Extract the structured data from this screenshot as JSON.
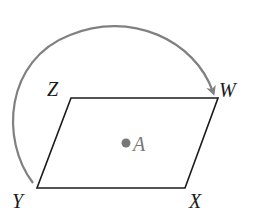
{
  "diagram": {
    "type": "geometry-rotation",
    "shape": "parallelogram",
    "vertices": {
      "Z": {
        "label": "Z"
      },
      "W": {
        "label": "W"
      },
      "X": {
        "label": "X"
      },
      "Y": {
        "label": "Y"
      }
    },
    "center_point": {
      "label": "A"
    },
    "arrow": {
      "from": "Y",
      "to": "W",
      "description": "curved arrow from Y around to W"
    },
    "colors": {
      "outline": "#1a1a1a",
      "arrow": "#808080",
      "point": "#777777"
    }
  }
}
